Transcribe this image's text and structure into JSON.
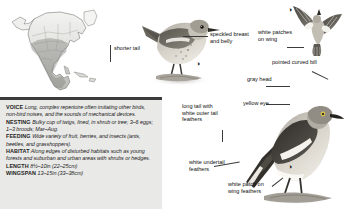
{
  "page": {
    "background_color": "#ffffff"
  },
  "range_map": {
    "name": "north-america-range-map",
    "continent": "North America",
    "shading_note": "shaded resident range across United States and Mexico"
  },
  "annotations": [
    {
      "id": "shorter-tail",
      "text": "shorter\ntail"
    },
    {
      "id": "speckled-breast",
      "text": "speckled\nbreast and\nbelly"
    },
    {
      "id": "white-patches-wing",
      "text": "white\npatches\non wing"
    },
    {
      "id": "pointed-curved-bill",
      "text": "pointed\ncurved bill"
    },
    {
      "id": "gray-head",
      "text": "gray\nhead"
    },
    {
      "id": "long-tail",
      "text": "long tail\nwith white\nouter tail\nfeathers"
    },
    {
      "id": "yellow-eye",
      "text": "yellow\neye"
    },
    {
      "id": "white-undertail",
      "text": "white\nundertail\nfeathers"
    },
    {
      "id": "white-patch-wing-feathers",
      "text": "white patch\non wing\nfeathers"
    }
  ],
  "labels": {
    "shorter_tail": "shorter tail",
    "speckled_breast": "speckled breast and belly",
    "white_patches_on_wing": "white patches on wing",
    "pointed_curved_bill": "pointed curved bill",
    "gray_head": "gray head",
    "long_tail": "long tail with white outer tail feathers",
    "yellow_eye": "yellow eye",
    "white_undertail": "white undertail feathers",
    "white_patch_on_wing_feathers": "white patch on wing feathers"
  },
  "info_box": {
    "background_color": "#e9e9e7",
    "rows": [
      {
        "heading": "VOICE",
        "text": "Long, complex repertoire often imitating other birds, non-bird noises, and the sounds of mechanical devices."
      },
      {
        "heading": "NESTING",
        "text": "Bulky cup of twigs, lined, in shrub or tree; 3–6 eggs; 1–3 broods; Mar–Aug."
      },
      {
        "heading": "FEEDING",
        "text": "Wide variety of fruit, berries, and insects (ants, beetles, and grasshoppers)."
      },
      {
        "heading": "HABITAT",
        "text": "Along edges of disturbed habitats such as young forests and suburban and urban areas with shrubs or hedges."
      },
      {
        "heading": "LENGTH",
        "text": "8½–10in (22–25cm)"
      },
      {
        "heading": "WINGSPAN",
        "text": "13–15in (33–38cm)"
      }
    ]
  },
  "illustrations": [
    {
      "id": "juvenile-mockingbird-perched",
      "caption_symbol": "◑"
    },
    {
      "id": "adult-mockingbird-flying",
      "caption_symbol": "◑"
    },
    {
      "id": "adult-mockingbird-perched",
      "caption_symbol": "◑"
    }
  ],
  "symbols": {
    "adult_marker": "◑"
  }
}
